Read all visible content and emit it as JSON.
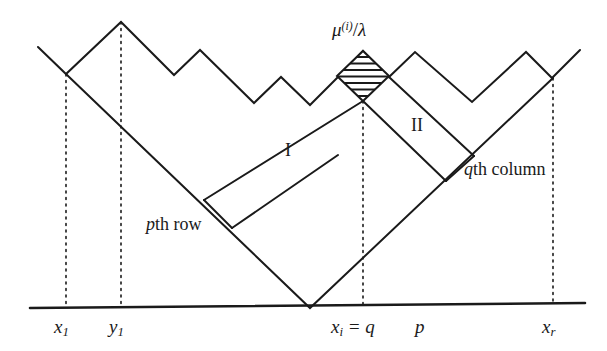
{
  "figure": {
    "type": "mathematical-diagram",
    "background_color": "#ffffff",
    "line_color": "#1a1a1a"
  },
  "labels": {
    "mu_lambda": {
      "base": "μ",
      "sup": "(i)",
      "div": "/",
      "lam": "λ"
    },
    "region_one": "I",
    "region_two": "II",
    "pth_row": {
      "var": "p",
      "text": "th row"
    },
    "qth_column": {
      "var": "q",
      "text": "th column"
    }
  },
  "axis_labels": [
    {
      "name": "x-l",
      "var": "x",
      "sub": "1",
      "rest": ""
    },
    {
      "name": "y-l",
      "var": "y",
      "sub": "1",
      "rest": ""
    },
    {
      "name": "xi-eq-q",
      "var": "x",
      "sub": "i",
      "rest": " = q"
    },
    {
      "name": "p",
      "var": "p",
      "sub": "",
      "rest": ""
    },
    {
      "name": "x-r",
      "var": "x",
      "sub": "r",
      "rest": ""
    }
  ],
  "geometry": {
    "baseline": {
      "x1": 30,
      "y1": 308,
      "x2": 585,
      "y2": 303
    },
    "profile": [
      [
        38,
        47
      ],
      [
        66,
        74
      ],
      [
        121,
        22
      ],
      [
        174,
        75
      ],
      [
        200,
        50
      ],
      [
        254,
        103
      ],
      [
        281,
        77
      ],
      [
        310,
        105
      ],
      [
        338,
        77
      ],
      [
        363,
        51
      ],
      [
        389,
        77
      ],
      [
        415,
        52
      ],
      [
        472,
        102
      ],
      [
        526,
        52
      ],
      [
        552,
        78
      ],
      [
        580,
        50
      ]
    ],
    "v_left": [
      [
        66,
        74
      ],
      [
        310,
        308
      ]
    ],
    "v_right": [
      [
        310,
        308
      ],
      [
        553,
        78
      ]
    ],
    "band_i_upper": [
      [
        363,
        101
      ],
      [
        204,
        200
      ]
    ],
    "band_i_lower": [
      [
        232,
        228
      ],
      [
        338,
        155
      ]
    ],
    "band_i_cap": [
      [
        204,
        200
      ],
      [
        232,
        228
      ]
    ],
    "band_ii_upper": [
      [
        389,
        77
      ],
      [
        472,
        155
      ]
    ],
    "band_ii_lower": [
      [
        363,
        101
      ],
      [
        445,
        180
      ]
    ],
    "band_ii_cap": [
      [
        472,
        155
      ],
      [
        445,
        180
      ]
    ],
    "diamond": {
      "cx": 363,
      "top": 51,
      "bottom": 101,
      "half_w": 26,
      "hatch_lines": 7
    },
    "dotted_verticals": [
      {
        "x": 66,
        "y_top": 74,
        "y_bot": 305
      },
      {
        "x": 121,
        "y_top": 22,
        "y_bot": 305
      },
      {
        "x": 363,
        "y_top": 101,
        "y_bot": 305
      },
      {
        "x": 553,
        "y_top": 78,
        "y_bot": 303
      }
    ]
  }
}
